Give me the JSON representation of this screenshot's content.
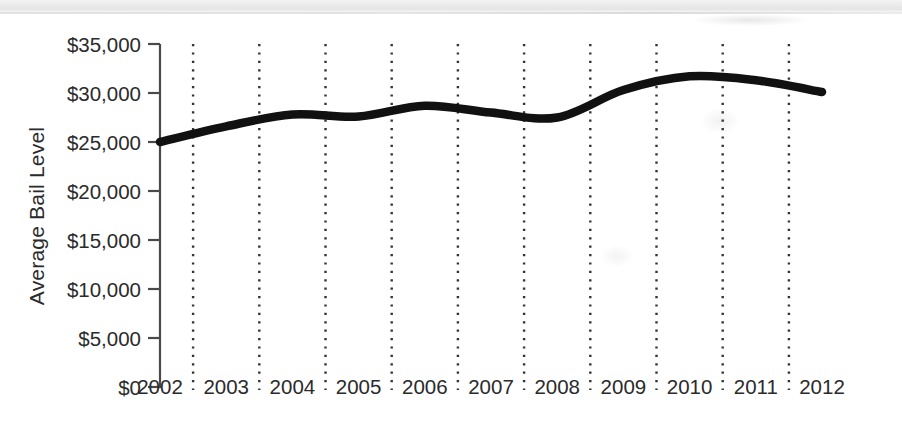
{
  "figure": {
    "background_color": "#ffffff",
    "line_color": "#111111",
    "axis_color": "#4a4a4a",
    "gridline_color": "#333333",
    "text_color": "#2b2b2b"
  },
  "axis": {
    "y_label": "Average Bail Level",
    "y_ticks": [
      "$0",
      "$5,000",
      "$10,000",
      "$15,000",
      "$20,000",
      "$25,000",
      "$30,000",
      "$35,000"
    ],
    "x_ticks": [
      "2002",
      "2003",
      "2004",
      "2005",
      "2006",
      "2007",
      "2008",
      "2009",
      "2010",
      "2011",
      "2012"
    ]
  },
  "chart_data": {
    "type": "line",
    "title": "",
    "subtitle": "",
    "xlabel": "",
    "ylabel": "Average Bail Level",
    "x": [
      2002,
      2003,
      2004,
      2005,
      2006,
      2007,
      2008,
      2009,
      2010,
      2011,
      2012
    ],
    "values": [
      25000,
      26600,
      27800,
      27600,
      28700,
      28000,
      27500,
      30300,
      31700,
      31300,
      30100
    ],
    "categories": [
      "2002",
      "2003",
      "2004",
      "2005",
      "2006",
      "2007",
      "2008",
      "2009",
      "2010",
      "2011",
      "2012"
    ],
    "series": [
      {
        "name": "Average Bail Level",
        "values": [
          25000,
          26600,
          27800,
          27600,
          28700,
          28000,
          27500,
          30300,
          31700,
          31300,
          30100
        ]
      }
    ],
    "ylim": [
      0,
      35000
    ],
    "xlim": [
      2002,
      2012
    ],
    "y_tick_values": [
      0,
      5000,
      10000,
      15000,
      20000,
      25000,
      30000,
      35000
    ],
    "y_tick_labels": [
      "$0",
      "$5,000",
      "$10,000",
      "$15,000",
      "$20,000",
      "$25,000",
      "$30,000",
      "$35,000"
    ],
    "x_tick_labels": [
      "2002",
      "2003",
      "2004",
      "2005",
      "2006",
      "2007",
      "2008",
      "2009",
      "2010",
      "2011",
      "2012"
    ],
    "grid": "vertical-dotted",
    "grid_on": true,
    "legend": "none",
    "legend_position": "none",
    "annotations": []
  }
}
